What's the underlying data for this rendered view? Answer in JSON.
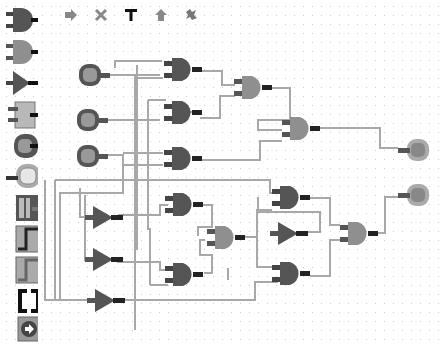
{
  "app": {
    "title": "Logic Circuit Editor"
  },
  "colors": {
    "dark_gate": "#555555",
    "light_gate": "#8f8f8f",
    "wire": "#a8a8a8",
    "pin": "#444444",
    "grid_dot": "#cfcfcf",
    "background": "#ffffff"
  },
  "palette": {
    "items": [
      {
        "name": "and-gate",
        "label": "AND gate"
      },
      {
        "name": "or-gate",
        "label": "OR gate"
      },
      {
        "name": "not-gate",
        "label": "NOT gate"
      },
      {
        "name": "custom-block",
        "label": "Block"
      },
      {
        "name": "input-switch",
        "label": "Input"
      },
      {
        "name": "output-lamp",
        "label": "Output"
      },
      {
        "name": "flip-flop-1",
        "label": "Flip-flop"
      },
      {
        "name": "flip-flop-2",
        "label": "Flip-flop variant"
      },
      {
        "name": "flip-flop-3",
        "label": "Flip-flop variant"
      },
      {
        "name": "bracket-block",
        "label": "Bracket"
      },
      {
        "name": "run-button",
        "label": "Run"
      }
    ]
  },
  "toolbar": {
    "tools": [
      {
        "name": "arrow-right-icon",
        "glyph": "➡",
        "label": "Select"
      },
      {
        "name": "delete-icon",
        "glyph": "✕",
        "label": "Delete"
      },
      {
        "name": "text-icon",
        "glyph": "T",
        "label": "Text"
      },
      {
        "name": "arrow-up-icon",
        "glyph": "⬆",
        "label": "Up"
      },
      {
        "name": "puzzle-icon",
        "glyph": "✱",
        "label": "Module"
      }
    ]
  },
  "circuit": {
    "inputs": 3,
    "outputs": 2,
    "and_gates": 8,
    "or_gates": 3,
    "not_gates": 4
  }
}
